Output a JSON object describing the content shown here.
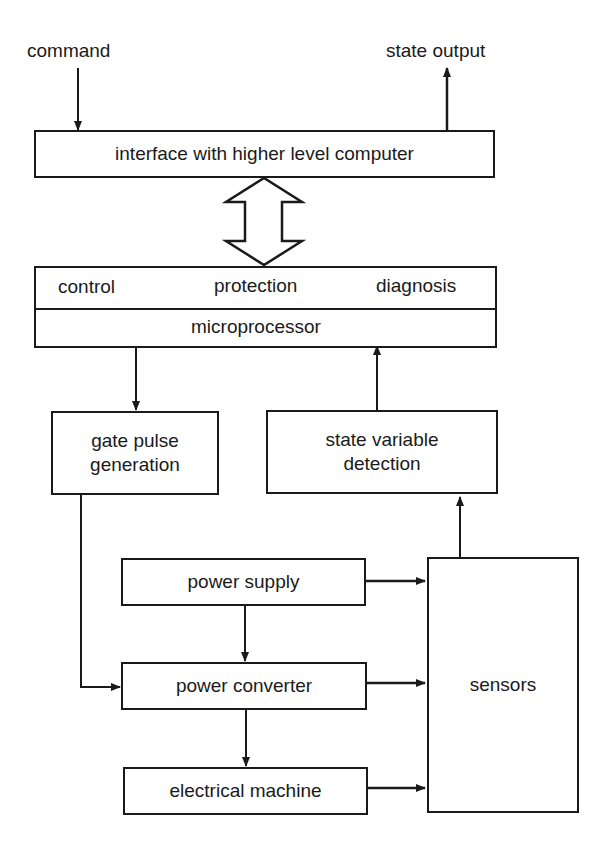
{
  "diagram": {
    "inputs": {
      "command": "command",
      "state_output": "state output"
    },
    "blocks": {
      "interface": "interface with higher level computer",
      "control": "control",
      "protection": "protection",
      "diagnosis": "diagnosis",
      "microprocessor": "microprocessor",
      "gate_pulse_line1": "gate pulse",
      "gate_pulse_line2": "generation",
      "state_var_line1": "state variable",
      "state_var_line2": "detection",
      "power_supply": "power supply",
      "power_converter": "power converter",
      "electrical_machine": "electrical machine",
      "sensors": "sensors"
    },
    "colors": {
      "line": "#1a1a1a",
      "background": "#ffffff"
    }
  }
}
